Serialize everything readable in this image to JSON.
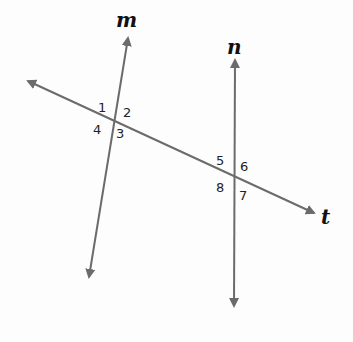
{
  "diagram": {
    "line_color": "#6b6b6b",
    "lines": {
      "m": {
        "label": "m",
        "from": [
          89,
          277
        ],
        "to": [
          128,
          36
        ]
      },
      "n": {
        "label": "n",
        "from": [
          234,
          308
        ],
        "to": [
          235,
          58
        ]
      },
      "t": {
        "label": "t",
        "from": [
          26,
          80
        ],
        "to": [
          316,
          214
        ]
      }
    },
    "intersections": [
      {
        "lines": [
          "m",
          "t"
        ],
        "point": [
          114,
          120
        ],
        "angles": [
          "1",
          "2",
          "3",
          "4"
        ]
      },
      {
        "lines": [
          "n",
          "t"
        ],
        "point": [
          235,
          176
        ],
        "angles": [
          "5",
          "6",
          "7",
          "8"
        ]
      }
    ],
    "angle_labels": {
      "a1": "1",
      "a2": "2",
      "a3": "3",
      "a4": "4",
      "a5": "5",
      "a6": "6",
      "a7": "7",
      "a8": "8"
    }
  }
}
